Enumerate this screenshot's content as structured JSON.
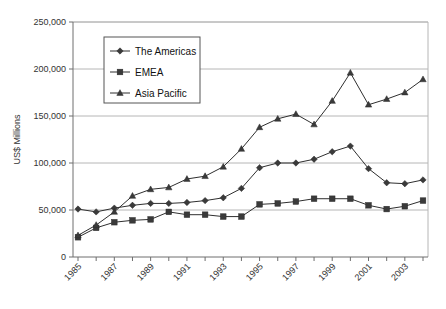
{
  "chart_data": {
    "type": "line",
    "title": "",
    "xlabel": "",
    "ylabel": "US$ Millions",
    "xlim": [
      1985,
      2004
    ],
    "ylim": [
      0,
      250000
    ],
    "grid": true,
    "legend_position": "top-left-inside",
    "x": [
      1985,
      1986,
      1987,
      1988,
      1989,
      1990,
      1991,
      1992,
      1993,
      1994,
      1995,
      1996,
      1997,
      1998,
      1999,
      2000,
      2001,
      2002,
      2003,
      2004
    ],
    "xtick_labels": [
      "1985",
      "",
      "1987",
      "",
      "1989",
      "",
      "1991",
      "",
      "1993",
      "",
      "1995",
      "",
      "1997",
      "",
      "1999",
      "",
      "2001",
      "",
      "2003",
      ""
    ],
    "ytick_labels": [
      "0",
      "50,000",
      "100,000",
      "150,000",
      "200,000",
      "250,000"
    ],
    "ytick_values": [
      0,
      50000,
      100000,
      150000,
      200000,
      250000
    ],
    "series": [
      {
        "name": "The Americas",
        "marker": "diamond",
        "values": [
          51000,
          48000,
          52000,
          55000,
          57000,
          57000,
          58000,
          60000,
          63000,
          73000,
          95000,
          100000,
          100000,
          104000,
          112000,
          118000,
          94000,
          79000,
          78000,
          82000
        ]
      },
      {
        "name": "EMEA",
        "marker": "square",
        "values": [
          21000,
          31000,
          37000,
          39000,
          40000,
          48000,
          45000,
          45000,
          43000,
          43000,
          56000,
          57000,
          59000,
          62000,
          62000,
          62000,
          55000,
          51000,
          54000,
          60000
        ]
      },
      {
        "name": "Asia Pacific",
        "marker": "triangle",
        "values": [
          23000,
          34000,
          48000,
          65000,
          72000,
          74000,
          83000,
          86000,
          96000,
          115000,
          138000,
          147000,
          152000,
          141000,
          166000,
          196000,
          162000,
          168000,
          175000,
          189000
        ]
      }
    ]
  },
  "legend": {
    "entries": [
      {
        "label": "The Americas",
        "marker": "diamond"
      },
      {
        "label": "EMEA",
        "marker": "square"
      },
      {
        "label": "Asia Pacific",
        "marker": "triangle"
      }
    ]
  },
  "colors": {
    "series": "#3a3a3a",
    "grid": "#b6b6b6",
    "axis": "#6e6e6e",
    "text": "#1a1a1a"
  }
}
